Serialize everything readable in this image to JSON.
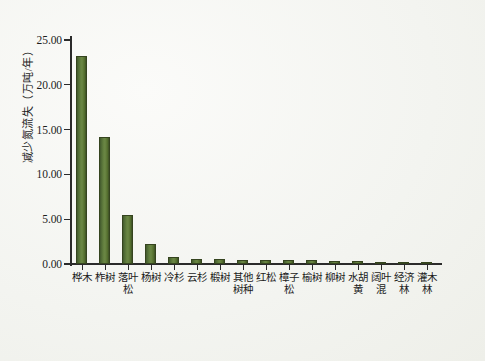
{
  "chart_data": {
    "type": "bar",
    "title": "",
    "xlabel": "",
    "ylabel": "减少氮流失（万吨/年）",
    "ylim": [
      0,
      25
    ],
    "yticks": [
      "0.00",
      "5.00",
      "10.00",
      "15.00",
      "20.00",
      "25.00"
    ],
    "ytick_values": [
      0,
      5,
      10,
      15,
      20,
      25
    ],
    "grid": false,
    "legend": null,
    "bar_color": "#5a7438",
    "bar_edge_color": "#35441f",
    "categories": [
      "桦木",
      "柞树",
      "落叶松",
      "杨树",
      "冷杉",
      "云杉",
      "椴树",
      "其他树种",
      "红松",
      "樟子松",
      "榆树",
      "柳树",
      "水胡黄",
      "阔叶混",
      "经济林",
      "灌木林"
    ],
    "values": [
      23.25,
      14.15,
      5.5,
      2.25,
      0.75,
      0.55,
      0.52,
      0.48,
      0.45,
      0.42,
      0.4,
      0.38,
      0.32,
      0.28,
      0.25,
      0.22
    ]
  }
}
